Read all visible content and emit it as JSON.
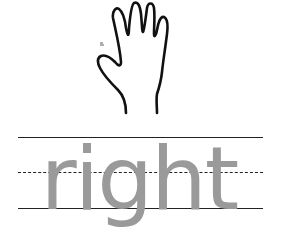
{
  "worksheet": {
    "word": "right",
    "picture": "hand-icon",
    "colors": {
      "ink": "#111111",
      "tracing_text": "#9a9a9a",
      "guide_lines": "#222222",
      "background": "#ffffff"
    }
  }
}
